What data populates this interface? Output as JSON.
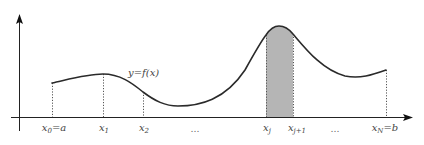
{
  "diagram": {
    "function_label": "y=f(x)",
    "colors": {
      "axis": "#222222",
      "curve": "#2a2a2a",
      "dotted": "#555555",
      "shaded_strip": "#b5b5b5",
      "label": "#444444"
    },
    "partition_labels": {
      "x0": {
        "var": "x",
        "sub": "0",
        "suffix": "=a"
      },
      "x1": {
        "var": "x",
        "sub": "1",
        "suffix": ""
      },
      "x2": {
        "var": "x",
        "sub": "2",
        "suffix": ""
      },
      "ellipsis1": "…",
      "xj": {
        "var": "x",
        "sub": "j",
        "suffix": ""
      },
      "xj1": {
        "var": "x",
        "sub": "j+1",
        "suffix": ""
      },
      "ellipsis2": "…",
      "xN": {
        "var": "x",
        "sub": "N",
        "suffix": "=b"
      }
    },
    "shaded_interval": "[x_j, x_{j+1}]"
  }
}
